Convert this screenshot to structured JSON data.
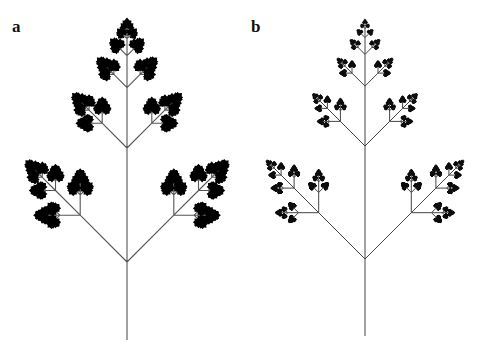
{
  "figure": {
    "panels": [
      {
        "label": "a",
        "label_pos": {
          "x": 12,
          "y": 18
        },
        "style": "solid-leaves",
        "trunk": {
          "x": 127,
          "y_bottom": 340,
          "y_node": 262
        },
        "first_length": 114,
        "center_ratio": 0.53,
        "side_ratio": 0.58,
        "side_angle_deg": 45,
        "depth": 7,
        "stroke_color": "#555555",
        "stroke_width": 1.1,
        "leaf_color": "#000000",
        "leaf_size": 3.2
      },
      {
        "label": "b",
        "label_pos": {
          "x": 251,
          "y": 18
        },
        "style": "wispy-leaves",
        "trunk": {
          "x": 365,
          "y_bottom": 336,
          "y_node": 259
        },
        "first_length": 113,
        "center_ratio": 0.53,
        "side_ratio": 0.58,
        "side_angle_deg": 45,
        "depth": 8,
        "stroke_color": "#444444",
        "stroke_width": 1.0,
        "leaf_color": "#111111",
        "leaf_size": 1.3
      }
    ],
    "background": "#ffffff"
  }
}
